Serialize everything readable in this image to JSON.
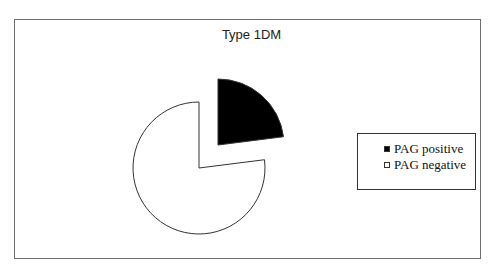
{
  "chart_data": {
    "type": "pie",
    "title": "Type 1DM",
    "categories": [
      "PAG positive",
      "PAG negative"
    ],
    "values": [
      23,
      77
    ],
    "unit": "%",
    "colors": [
      "#000000",
      "#ffffff"
    ],
    "exploded": true,
    "legend": {
      "position": "right",
      "entries": [
        "PAG positive",
        "PAG negative"
      ]
    }
  }
}
